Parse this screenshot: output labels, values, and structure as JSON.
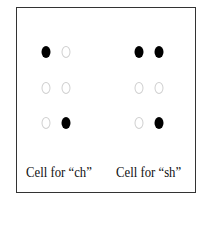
{
  "cells": [
    {
      "label": "Cell for “ch”",
      "label_x": 26,
      "columns_x": [
        46,
        66
      ],
      "dots": [
        [
          true,
          false
        ],
        [
          false,
          false
        ],
        [
          false,
          true
        ]
      ]
    },
    {
      "label": "Cell for “sh”",
      "label_x": 116,
      "columns_x": [
        139,
        159
      ],
      "dots": [
        [
          true,
          true
        ],
        [
          false,
          false
        ],
        [
          false,
          true
        ]
      ]
    }
  ],
  "rows_y": [
    52,
    88,
    123
  ],
  "colors": {
    "filled": "#000000",
    "empty_outline": "#cfcfcf",
    "border": "#333333"
  }
}
